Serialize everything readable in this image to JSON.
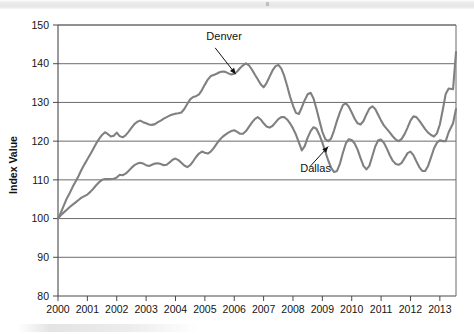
{
  "figure": {
    "background_color": "#ffffff",
    "scan_artifact_present": true
  },
  "chart_data": {
    "type": "line",
    "title": "",
    "subtitle": "",
    "xlabel": "",
    "ylabel": "Index Value",
    "xlim": [
      2000.0,
      2013.55
    ],
    "ylim": [
      80,
      150
    ],
    "grid": true,
    "grid_axis": "y",
    "legend_position": "inline-annotation",
    "line_color": "#808080",
    "axis_color": "#4a4a4a",
    "y_ticks": [
      80,
      90,
      100,
      110,
      120,
      130,
      140,
      150
    ],
    "y_tick_labels": [
      "80",
      "90",
      "100",
      "110",
      "120",
      "130",
      "140",
      "150"
    ],
    "x_ticks": [
      2000,
      2001,
      2002,
      2003,
      2004,
      2005,
      2006,
      2007,
      2008,
      2009,
      2010,
      2011,
      2012,
      2013
    ],
    "x_tick_labels": [
      "2000",
      "2001",
      "2002",
      "2003",
      "2004",
      "2005",
      "2006",
      "2007",
      "2008",
      "2009",
      "2010",
      "2011",
      "2012",
      "2013"
    ],
    "annotations": [
      {
        "text": "Denver",
        "label_x": 2005.05,
        "label_y": 146.2,
        "arrow_from_x": 2005.35,
        "arrow_from_y": 144.1,
        "arrow_to_x": 2006.05,
        "arrow_to_y": 137.3
      },
      {
        "text": "Dallas",
        "label_x": 2008.25,
        "label_y": 112.1,
        "arrow_from_x": 2008.6,
        "arrow_from_y": 113.6,
        "arrow_to_x": 2009.2,
        "arrow_to_y": 118.6
      }
    ],
    "series": [
      {
        "name": "Denver",
        "color": "#808080",
        "x": [
          2000.0,
          2000.1,
          2000.2,
          2000.3,
          2000.4,
          2000.5,
          2000.6,
          2000.7,
          2000.8,
          2000.9,
          2001.0,
          2001.1,
          2001.2,
          2001.3,
          2001.4,
          2001.5,
          2001.6,
          2001.7,
          2001.8,
          2001.9,
          2002.0,
          2002.1,
          2002.2,
          2002.3,
          2002.4,
          2002.5,
          2002.6,
          2002.7,
          2002.8,
          2002.9,
          2003.0,
          2003.1,
          2003.2,
          2003.3,
          2003.4,
          2003.5,
          2003.6,
          2003.7,
          2003.8,
          2003.9,
          2004.0,
          2004.1,
          2004.2,
          2004.3,
          2004.4,
          2004.5,
          2004.6,
          2004.7,
          2004.8,
          2004.9,
          2005.0,
          2005.1,
          2005.2,
          2005.3,
          2005.4,
          2005.5,
          2005.6,
          2005.7,
          2005.8,
          2005.9,
          2006.0,
          2006.1,
          2006.2,
          2006.3,
          2006.4,
          2006.5,
          2006.6,
          2006.7,
          2006.8,
          2006.9,
          2007.0,
          2007.1,
          2007.2,
          2007.3,
          2007.4,
          2007.5,
          2007.6,
          2007.7,
          2007.8,
          2007.9,
          2008.0,
          2008.1,
          2008.2,
          2008.3,
          2008.4,
          2008.5,
          2008.6,
          2008.7,
          2008.8,
          2008.9,
          2009.0,
          2009.1,
          2009.2,
          2009.3,
          2009.4,
          2009.5,
          2009.6,
          2009.7,
          2009.8,
          2009.9,
          2010.0,
          2010.1,
          2010.2,
          2010.3,
          2010.4,
          2010.5,
          2010.6,
          2010.7,
          2010.8,
          2010.9,
          2011.0,
          2011.1,
          2011.2,
          2011.3,
          2011.4,
          2011.5,
          2011.6,
          2011.7,
          2011.8,
          2011.9,
          2012.0,
          2012.1,
          2012.2,
          2012.3,
          2012.4,
          2012.5,
          2012.6,
          2012.7,
          2012.8,
          2012.9,
          2013.0,
          2013.1,
          2013.2,
          2013.3,
          2013.45,
          2013.55
        ],
        "values": [
          100.0,
          101.6,
          103.4,
          105.2,
          106.6,
          108.2,
          109.6,
          111.0,
          112.6,
          114.0,
          115.3,
          116.6,
          118.0,
          119.4,
          120.6,
          121.6,
          122.3,
          121.8,
          121.2,
          121.4,
          122.2,
          121.3,
          121.0,
          121.5,
          122.4,
          123.4,
          124.4,
          125.0,
          125.3,
          124.9,
          124.6,
          124.3,
          124.2,
          124.4,
          124.9,
          125.3,
          125.8,
          126.2,
          126.6,
          126.9,
          127.1,
          127.2,
          127.4,
          128.3,
          129.6,
          130.8,
          131.4,
          131.6,
          132.1,
          133.2,
          134.6,
          135.9,
          136.8,
          137.1,
          137.4,
          137.8,
          138.0,
          137.9,
          137.5,
          137.2,
          137.4,
          138.0,
          138.9,
          139.6,
          140.1,
          139.6,
          138.5,
          137.2,
          136.0,
          134.7,
          133.9,
          135.0,
          136.6,
          138.2,
          139.3,
          139.7,
          138.8,
          136.9,
          134.3,
          131.5,
          129.2,
          127.3,
          127.0,
          128.7,
          130.6,
          132.1,
          132.5,
          131.0,
          128.3,
          125.3,
          122.4,
          120.5,
          120.0,
          120.7,
          122.8,
          125.3,
          127.5,
          129.3,
          129.8,
          128.9,
          127.4,
          125.8,
          124.6,
          124.3,
          125.2,
          126.9,
          128.4,
          129.0,
          128.3,
          126.8,
          125.3,
          124.0,
          123.1,
          122.2,
          121.2,
          120.4,
          120.0,
          120.6,
          121.8,
          123.5,
          125.3,
          126.4,
          126.2,
          125.3,
          124.2,
          123.1,
          122.2,
          121.6,
          121.2,
          122.0,
          124.3,
          128.1,
          132.2,
          133.6,
          133.4,
          143.0
        ]
      },
      {
        "name": "Dallas",
        "color": "#808080",
        "x": [
          2000.0,
          2000.1,
          2000.2,
          2000.3,
          2000.4,
          2000.5,
          2000.6,
          2000.7,
          2000.8,
          2000.9,
          2001.0,
          2001.1,
          2001.2,
          2001.3,
          2001.4,
          2001.5,
          2001.6,
          2001.7,
          2001.8,
          2001.9,
          2002.0,
          2002.1,
          2002.2,
          2002.3,
          2002.4,
          2002.5,
          2002.6,
          2002.7,
          2002.8,
          2002.9,
          2003.0,
          2003.1,
          2003.2,
          2003.3,
          2003.4,
          2003.5,
          2003.6,
          2003.7,
          2003.8,
          2003.9,
          2004.0,
          2004.1,
          2004.2,
          2004.3,
          2004.4,
          2004.5,
          2004.6,
          2004.7,
          2004.8,
          2004.9,
          2005.0,
          2005.1,
          2005.2,
          2005.3,
          2005.4,
          2005.5,
          2005.6,
          2005.7,
          2005.8,
          2005.9,
          2006.0,
          2006.1,
          2006.2,
          2006.3,
          2006.4,
          2006.5,
          2006.6,
          2006.7,
          2006.8,
          2006.9,
          2007.0,
          2007.1,
          2007.2,
          2007.3,
          2007.4,
          2007.5,
          2007.6,
          2007.7,
          2007.8,
          2007.9,
          2008.0,
          2008.1,
          2008.2,
          2008.3,
          2008.4,
          2008.5,
          2008.6,
          2008.7,
          2008.8,
          2008.9,
          2009.0,
          2009.1,
          2009.2,
          2009.3,
          2009.4,
          2009.5,
          2009.6,
          2009.7,
          2009.8,
          2009.9,
          2010.0,
          2010.1,
          2010.2,
          2010.3,
          2010.4,
          2010.5,
          2010.6,
          2010.7,
          2010.8,
          2010.9,
          2011.0,
          2011.1,
          2011.2,
          2011.3,
          2011.4,
          2011.5,
          2011.6,
          2011.7,
          2011.8,
          2011.9,
          2012.0,
          2012.1,
          2012.2,
          2012.3,
          2012.4,
          2012.5,
          2012.6,
          2012.7,
          2012.8,
          2012.9,
          2013.0,
          2013.1,
          2013.2,
          2013.3,
          2013.45,
          2013.55
        ],
        "values": [
          100.0,
          100.9,
          101.6,
          102.3,
          103.0,
          103.6,
          104.2,
          104.8,
          105.4,
          105.8,
          106.2,
          106.9,
          107.7,
          108.6,
          109.4,
          110.0,
          110.2,
          110.2,
          110.2,
          110.3,
          110.6,
          111.3,
          111.2,
          111.6,
          112.3,
          113.1,
          113.8,
          114.2,
          114.4,
          114.2,
          113.8,
          113.6,
          113.9,
          114.2,
          114.3,
          114.1,
          113.8,
          113.9,
          114.5,
          115.2,
          115.5,
          115.1,
          114.4,
          113.7,
          113.3,
          113.8,
          114.8,
          115.9,
          116.8,
          117.3,
          117.0,
          116.8,
          117.3,
          118.2,
          119.3,
          120.3,
          121.1,
          121.7,
          122.2,
          122.6,
          122.8,
          122.4,
          121.9,
          121.9,
          122.6,
          123.7,
          124.8,
          125.7,
          126.2,
          125.6,
          124.6,
          123.8,
          123.5,
          123.9,
          124.8,
          125.7,
          126.2,
          126.2,
          125.6,
          124.6,
          123.3,
          121.7,
          119.7,
          117.6,
          118.7,
          120.9,
          122.6,
          123.6,
          123.2,
          121.6,
          119.6,
          117.3,
          115.0,
          113.1,
          112.0,
          112.3,
          114.2,
          117.0,
          119.4,
          120.5,
          120.3,
          119.4,
          117.8,
          115.6,
          113.6,
          112.7,
          113.6,
          116.1,
          118.6,
          120.2,
          120.4,
          119.5,
          118.0,
          116.3,
          114.9,
          114.1,
          113.9,
          114.4,
          115.6,
          116.9,
          117.3,
          116.4,
          114.8,
          113.3,
          112.3,
          112.3,
          113.6,
          115.8,
          118.1,
          119.6,
          120.2,
          120.0,
          120.0,
          122.3,
          124.6,
          128.3
        ]
      }
    ]
  }
}
